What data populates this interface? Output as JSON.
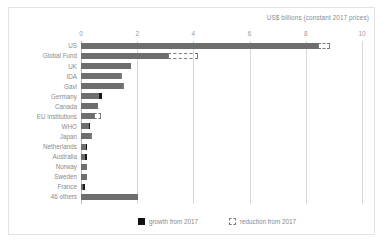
{
  "chart_data": {
    "type": "bar",
    "orientation": "horizontal",
    "title": "US$ billions (constant 2017 prices)",
    "xlabel": "",
    "ylabel": "",
    "xlim": [
      0,
      10
    ],
    "xticks": [
      0,
      2,
      4,
      6,
      8,
      10
    ],
    "xtick_labels": [
      "0",
      "2",
      "4",
      "6",
      "8",
      "10"
    ],
    "grid": "vertical",
    "legend_position": "bottom",
    "categories": [
      "US",
      "Global Fund",
      "UK",
      "IDA",
      "Gavi",
      "Germany",
      "Canada",
      "EU institutions",
      "WHO",
      "Japan",
      "Netherlands",
      "Australia",
      "Norway",
      "Sweden",
      "France",
      "46 others"
    ],
    "series": [
      {
        "name": "base",
        "values": [
          8.45,
          3.1,
          1.77,
          1.4,
          1.45,
          0.74,
          0.62,
          0.45,
          0.3,
          0.33,
          0.22,
          0.2,
          0.2,
          0.2,
          0.13,
          2.02
        ]
      },
      {
        "name": "growth from 2017",
        "values": [
          0.0,
          0.0,
          0.0,
          0.0,
          0.0,
          0.11,
          0.0,
          0.0,
          0.03,
          0.0,
          0.05,
          0.05,
          0.0,
          0.0,
          0.05,
          0.0
        ]
      },
      {
        "name": "reduction from 2017",
        "values": [
          0.4,
          1.05,
          0.0,
          0.07,
          0.07,
          0.0,
          0.0,
          0.27,
          0.0,
          0.05,
          0.0,
          0.0,
          0.0,
          0.0,
          0.0,
          0.0
        ]
      }
    ],
    "legend": [
      {
        "label": "growth from 2017",
        "marker": "solid-square"
      },
      {
        "label": "reduction from 2017",
        "marker": "dashed-square"
      }
    ]
  },
  "colors": {
    "bar_base": "#6e6e6e",
    "bar_growth": "#1a1a1a",
    "bar_reduction_outline": "#7b7b7b",
    "grid": "#d8d8d8",
    "text": "#8a8a8a",
    "frame": "#e3e3e3"
  }
}
